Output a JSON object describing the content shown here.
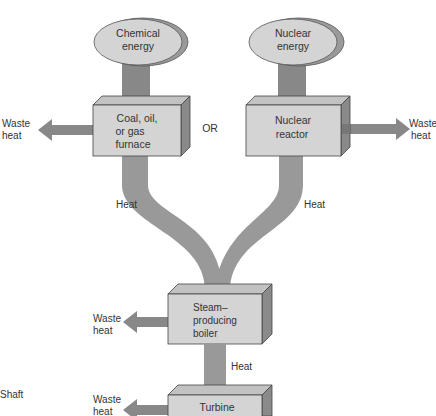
{
  "sources": {
    "chemical": {
      "line1": "Chemical",
      "line2": "energy"
    },
    "nuclear": {
      "line1": "Nuclear",
      "line2": "energy"
    }
  },
  "furnace": {
    "line1": "Coal, oil,",
    "line2": "or gas",
    "line3": "furnace"
  },
  "reactor": {
    "line1": "Nuclear",
    "line2": "reactor"
  },
  "or_label": "OR",
  "boiler": {
    "line1": "Steam–",
    "line2": "producing",
    "line3": "boiler"
  },
  "turbine": {
    "label": "Turbine"
  },
  "labels": {
    "heat": "Heat",
    "waste_line1": "Waste",
    "waste_line2": "heat",
    "shaft": "Shaft"
  },
  "colors": {
    "box_face": "#d4d4d4",
    "box_top": "#c2c2c2",
    "box_side": "#8a8a8a",
    "flow": "#999999",
    "ellipse": "#d4d4d4",
    "ellipse_shadow": "#9a9a9a"
  }
}
